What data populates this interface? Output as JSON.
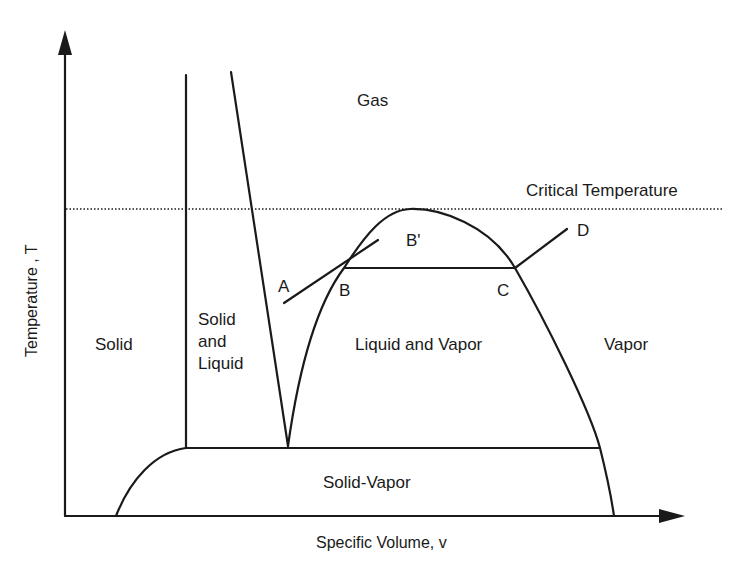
{
  "diagram": {
    "type": "phase-diagram",
    "colors": {
      "line": "#1a1a1a",
      "background": "#ffffff"
    },
    "axes": {
      "x_label": "Specific Volume, v",
      "y_label": "Temperature , T"
    },
    "reference_lines": {
      "critical_temperature": "Critical Temperature"
    },
    "regions": {
      "gas": "Gas",
      "solid": "Solid",
      "solid_and_liquid": [
        "Solid",
        "and",
        "Liquid"
      ],
      "liquid_and_vapor": "Liquid and Vapor",
      "vapor": "Vapor",
      "solid_vapor": "Solid-Vapor"
    },
    "points": {
      "a": "A",
      "b": "B",
      "b_prime": "B'",
      "c": "C",
      "d": "D"
    }
  }
}
